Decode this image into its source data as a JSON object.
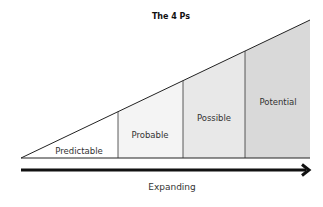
{
  "diagram": {
    "title": "The 4 Ps",
    "axis_label": "Expanding",
    "segments": [
      {
        "label": "Predictable",
        "fill": "#ffffff"
      },
      {
        "label": "Probable",
        "fill": "#f4f4f4"
      },
      {
        "label": "Possible",
        "fill": "#e8e8e8"
      },
      {
        "label": "Potential",
        "fill": "#d9d9d9"
      }
    ],
    "line_color": "#222222",
    "arrow_color": "#111111"
  }
}
